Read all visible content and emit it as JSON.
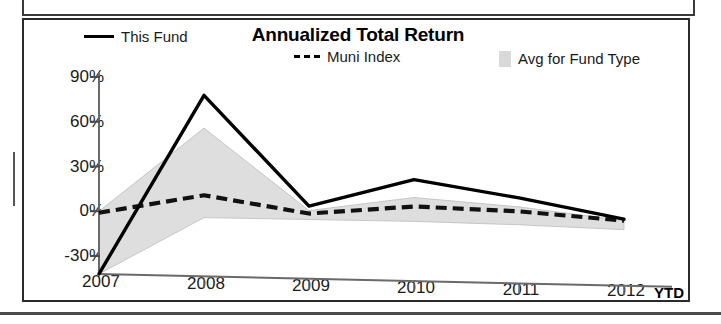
{
  "chart_data": {
    "type": "line",
    "title": "Annualized Total Return",
    "xlabel": "",
    "ylabel": "",
    "ylim": [
      -45,
      90
    ],
    "ytick_values": [
      90,
      60,
      30,
      0,
      -30
    ],
    "ytick_labels": [
      "90%",
      "60%",
      "30%",
      "0%",
      "-30%"
    ],
    "categories": [
      "2007",
      "2008",
      "2009",
      "2010",
      "2011",
      "2012"
    ],
    "x_axis_note": "YTD",
    "grid": false,
    "legend_position": "top",
    "series": [
      {
        "name": "This Fund",
        "style": "solid-line",
        "color": "#000000",
        "values": [
          -42,
          79,
          6,
          25,
          14,
          1
        ]
      },
      {
        "name": "Muni Index",
        "style": "dashed-line",
        "color": "#000000",
        "values": [
          -1,
          12,
          1,
          7,
          5,
          0
        ]
      },
      {
        "name": "Avg for Fund Type",
        "style": "filled-band",
        "color": "#d9d9d9",
        "values_upper": [
          0,
          57,
          3,
          13,
          8,
          0
        ],
        "values_lower": [
          -42,
          -3,
          -3,
          -3,
          -4,
          -6
        ]
      }
    ]
  },
  "chart": {
    "title": "Annualized Total Return",
    "legend": [
      {
        "label": "This Fund",
        "marker": "solid-line-swatch"
      },
      {
        "label": "Muni Index",
        "marker": "dashed-line-swatch"
      },
      {
        "label": "Avg for Fund Type",
        "marker": "gray-box-swatch"
      }
    ],
    "y_ticks": [
      "90%",
      "60%",
      "30%",
      "0%",
      "-30%"
    ],
    "x_ticks": [
      "2007",
      "2008",
      "2009",
      "2010",
      "2011",
      "2012"
    ],
    "ytd": "YTD"
  },
  "colors": {
    "line": "#000000",
    "band_fill": "#d9d9d9",
    "axis": "#555555",
    "frame": "#2b2b2b"
  }
}
